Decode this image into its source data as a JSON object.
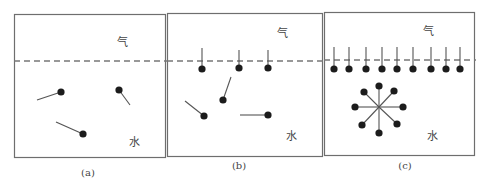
{
  "figure": {
    "colors": {
      "border": "#6e6e6e",
      "dashed_line": "#777777",
      "molecule_head": "#1c1c1c",
      "molecule_tail": "#555555",
      "text": "#444444"
    },
    "panels": [
      {
        "id": "a",
        "caption": "(a)",
        "air_label": "气",
        "water_label": "水",
        "box": {
          "x": 14,
          "y": 14,
          "w": 151,
          "h": 143
        },
        "interface_y": 61,
        "air_label_pos": {
          "x": 122,
          "y": 46
        },
        "water_label_pos": {
          "x": 134,
          "y": 146
        },
        "caption_pos": {
          "x": 88,
          "y": 176
        },
        "molecules": [
          {
            "head": [
              61,
              92
            ],
            "tail": [
              37,
              100
            ]
          },
          {
            "head": [
              119,
              90
            ],
            "tail": [
              130,
              105
            ]
          },
          {
            "head": [
              83,
              134
            ],
            "tail": [
              56,
              122
            ]
          }
        ]
      },
      {
        "id": "b",
        "caption": "(b)",
        "air_label": "气",
        "water_label": "水",
        "box": {
          "x": 167,
          "y": 13,
          "w": 155,
          "h": 143
        },
        "interface_y": 61,
        "air_label_pos": {
          "x": 282,
          "y": 37
        },
        "water_label_pos": {
          "x": 291,
          "y": 140
        },
        "caption_pos": {
          "x": 239,
          "y": 169
        },
        "molecules": [
          {
            "head": [
              202,
              69
            ],
            "tail": [
              202,
              48
            ]
          },
          {
            "head": [
              239,
              68
            ],
            "tail": [
              239,
              50
            ]
          },
          {
            "head": [
              268,
              68
            ],
            "tail": [
              268,
              50
            ]
          },
          {
            "head": [
              223,
              100
            ],
            "tail": [
              231,
              77
            ]
          },
          {
            "head": [
              204,
              116
            ],
            "tail": [
              185,
              101
            ]
          },
          {
            "head": [
              268,
              115
            ],
            "tail": [
              240,
              115
            ]
          }
        ]
      },
      {
        "id": "c",
        "caption": "(c)",
        "air_label": "气",
        "water_label": "水",
        "box": {
          "x": 324,
          "y": 12,
          "w": 150,
          "h": 143
        },
        "interface_y": 60,
        "air_label_pos": {
          "x": 428,
          "y": 35
        },
        "water_label_pos": {
          "x": 432,
          "y": 140
        },
        "caption_pos": {
          "x": 405,
          "y": 169
        },
        "molecules": [
          {
            "head": [
              334,
              69
            ],
            "tail": [
              334,
              47
            ]
          },
          {
            "head": [
              349,
              69
            ],
            "tail": [
              349,
              47
            ]
          },
          {
            "head": [
              366,
              69
            ],
            "tail": [
              366,
              47
            ]
          },
          {
            "head": [
              382,
              69
            ],
            "tail": [
              382,
              47
            ]
          },
          {
            "head": [
              397,
              69
            ],
            "tail": [
              397,
              47
            ]
          },
          {
            "head": [
              413,
              69
            ],
            "tail": [
              413,
              47
            ]
          },
          {
            "head": [
              431,
              69
            ],
            "tail": [
              431,
              47
            ]
          },
          {
            "head": [
              446,
              69
            ],
            "tail": [
              446,
              47
            ]
          },
          {
            "head": [
              460,
              69
            ],
            "tail": [
              460,
              47
            ]
          }
        ],
        "micelle": {
          "center": [
            379,
            107
          ],
          "heads": [
            [
              379,
              86
            ],
            [
              394,
              91
            ],
            [
              403,
              107
            ],
            [
              397,
              124
            ],
            [
              379,
              133
            ],
            [
              362,
              125
            ],
            [
              355,
              107
            ],
            [
              364,
              92
            ]
          ]
        }
      }
    ]
  }
}
